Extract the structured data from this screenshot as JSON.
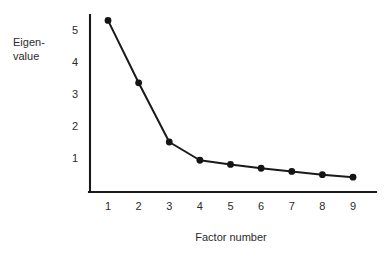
{
  "figure": {
    "background_color": "#ffffff",
    "ink_color": "#1a1a1a",
    "width": 385,
    "height": 258
  },
  "chart_data": {
    "type": "line",
    "title": "",
    "subtitle": "",
    "xlabel": "Factor number",
    "ylabel": "Eigen-value",
    "ylabel_line1": "Eigen-",
    "ylabel_line2": "value",
    "x": [
      1,
      2,
      3,
      4,
      5,
      6,
      7,
      8,
      9
    ],
    "categories": [
      "1",
      "2",
      "3",
      "4",
      "5",
      "6",
      "7",
      "8",
      "9"
    ],
    "values": [
      5.3,
      3.35,
      1.5,
      0.93,
      0.8,
      0.68,
      0.58,
      0.48,
      0.4
    ],
    "series": [
      {
        "name": "Eigenvalue",
        "values": [
          5.3,
          3.35,
          1.5,
          0.93,
          0.8,
          0.68,
          0.58,
          0.48,
          0.4
        ]
      }
    ],
    "xtick_labels": [
      "1",
      "2",
      "3",
      "4",
      "5",
      "6",
      "7",
      "8",
      "9"
    ],
    "ytick_labels": [
      "1",
      "2",
      "3",
      "4",
      "5"
    ],
    "ytick_values": [
      1,
      2,
      3,
      4,
      5
    ],
    "xlim": [
      0.4,
      9.6
    ],
    "ylim": [
      0,
      5.55
    ],
    "grid": false,
    "legend": false,
    "legend_position": "none",
    "marker": "circle",
    "marker_color": "#141414",
    "line_color": "#1a1a1a",
    "annotations": []
  }
}
